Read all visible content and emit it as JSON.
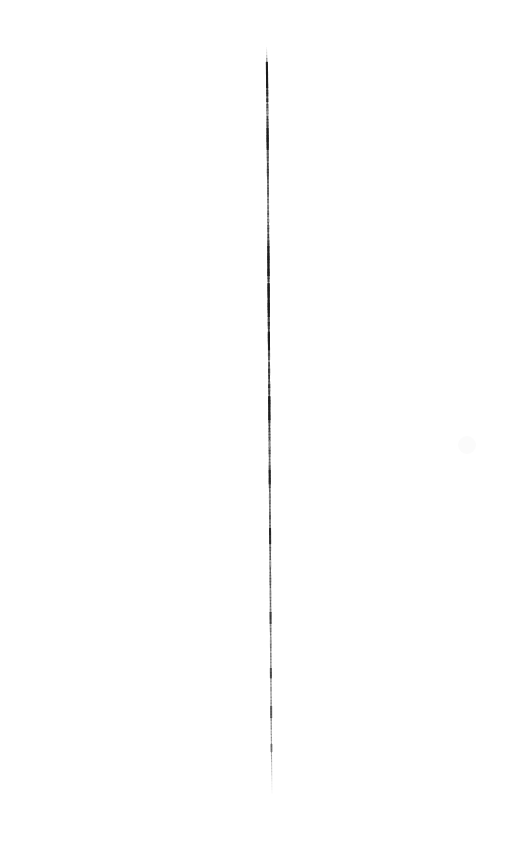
{
  "image": {
    "title": "Vertical Stroke Scan",
    "width": 523,
    "height": 860,
    "background_color": "#ffffff",
    "subject": "single hand-drawn near-vertical line on blank white ground",
    "alt_text": "A single thin dark vertical stroke running down the middle of a blank white page, tapering to faint points at the top and bottom."
  },
  "stroke": {
    "name": "vertical-line",
    "color": "#1a1a1a",
    "color_light": "#6e6e6e",
    "color_faint": "#b8b8b8",
    "top_y": 47,
    "bottom_y": 793,
    "top_x": 267.0,
    "bottom_x": 272.0,
    "max_width_px": 2.4,
    "min_width_px": 0.5,
    "orientation": "vertical",
    "path_points": [
      {
        "y": 47,
        "x": 266.6,
        "w": 0.5,
        "opacity": 0.1
      },
      {
        "y": 52,
        "x": 266.7,
        "w": 0.8,
        "opacity": 0.22
      },
      {
        "y": 58,
        "x": 266.8,
        "w": 1.3,
        "opacity": 0.55
      },
      {
        "y": 64,
        "x": 266.9,
        "w": 1.8,
        "opacity": 0.88
      },
      {
        "y": 72,
        "x": 267.0,
        "w": 2.0,
        "opacity": 0.95
      },
      {
        "y": 90,
        "x": 267.2,
        "w": 2.1,
        "opacity": 0.93
      },
      {
        "y": 110,
        "x": 267.4,
        "w": 2.0,
        "opacity": 0.9
      },
      {
        "y": 135,
        "x": 267.6,
        "w": 2.1,
        "opacity": 0.94
      },
      {
        "y": 160,
        "x": 267.8,
        "w": 2.0,
        "opacity": 0.88
      },
      {
        "y": 185,
        "x": 268.0,
        "w": 1.9,
        "opacity": 0.8
      },
      {
        "y": 205,
        "x": 268.1,
        "w": 1.8,
        "opacity": 0.72
      },
      {
        "y": 225,
        "x": 268.2,
        "w": 1.9,
        "opacity": 0.82
      },
      {
        "y": 250,
        "x": 268.4,
        "w": 2.1,
        "opacity": 0.92
      },
      {
        "y": 275,
        "x": 268.5,
        "w": 2.2,
        "opacity": 0.96
      },
      {
        "y": 300,
        "x": 268.7,
        "w": 2.2,
        "opacity": 0.97
      },
      {
        "y": 325,
        "x": 268.8,
        "w": 2.1,
        "opacity": 0.93
      },
      {
        "y": 350,
        "x": 269.0,
        "w": 2.0,
        "opacity": 0.88
      },
      {
        "y": 375,
        "x": 269.1,
        "w": 2.0,
        "opacity": 0.9
      },
      {
        "y": 400,
        "x": 269.3,
        "w": 2.1,
        "opacity": 0.94
      },
      {
        "y": 425,
        "x": 269.4,
        "w": 2.0,
        "opacity": 0.9
      },
      {
        "y": 450,
        "x": 269.6,
        "w": 1.9,
        "opacity": 0.84
      },
      {
        "y": 475,
        "x": 269.7,
        "w": 1.9,
        "opacity": 0.8
      },
      {
        "y": 500,
        "x": 269.9,
        "w": 1.8,
        "opacity": 0.76
      },
      {
        "y": 525,
        "x": 270.0,
        "w": 1.8,
        "opacity": 0.78
      },
      {
        "y": 550,
        "x": 270.2,
        "w": 1.7,
        "opacity": 0.72
      },
      {
        "y": 575,
        "x": 270.3,
        "w": 1.7,
        "opacity": 0.7
      },
      {
        "y": 600,
        "x": 270.5,
        "w": 1.6,
        "opacity": 0.66
      },
      {
        "y": 625,
        "x": 270.6,
        "w": 1.6,
        "opacity": 0.62
      },
      {
        "y": 650,
        "x": 270.8,
        "w": 1.5,
        "opacity": 0.58
      },
      {
        "y": 675,
        "x": 270.9,
        "w": 1.5,
        "opacity": 0.56
      },
      {
        "y": 700,
        "x": 271.1,
        "w": 1.4,
        "opacity": 0.52
      },
      {
        "y": 720,
        "x": 271.2,
        "w": 1.4,
        "opacity": 0.5
      },
      {
        "y": 740,
        "x": 271.4,
        "w": 1.2,
        "opacity": 0.42
      },
      {
        "y": 755,
        "x": 271.5,
        "w": 1.1,
        "opacity": 0.34
      },
      {
        "y": 768,
        "x": 271.7,
        "w": 0.9,
        "opacity": 0.24
      },
      {
        "y": 778,
        "x": 271.8,
        "w": 0.7,
        "opacity": 0.16
      },
      {
        "y": 786,
        "x": 271.9,
        "w": 0.6,
        "opacity": 0.09
      },
      {
        "y": 793,
        "x": 272.0,
        "w": 0.5,
        "opacity": 0.04
      }
    ],
    "dark_accents": [
      {
        "y": 62,
        "len": 26,
        "opacity": 0.95
      },
      {
        "y": 128,
        "len": 22,
        "opacity": 0.92
      },
      {
        "y": 246,
        "len": 30,
        "opacity": 0.95
      },
      {
        "y": 283,
        "len": 34,
        "opacity": 0.97
      },
      {
        "y": 332,
        "len": 18,
        "opacity": 0.9
      },
      {
        "y": 396,
        "len": 24,
        "opacity": 0.93
      },
      {
        "y": 470,
        "len": 14,
        "opacity": 0.82
      },
      {
        "y": 528,
        "len": 16,
        "opacity": 0.78
      },
      {
        "y": 612,
        "len": 12,
        "opacity": 0.66
      },
      {
        "y": 668,
        "len": 10,
        "opacity": 0.6
      },
      {
        "y": 706,
        "len": 12,
        "opacity": 0.56
      },
      {
        "y": 744,
        "len": 8,
        "opacity": 0.44
      }
    ],
    "light_gaps": [
      {
        "y": 108,
        "len": 8,
        "opacity": 0.3
      },
      {
        "y": 196,
        "len": 10,
        "opacity": 0.26
      },
      {
        "y": 215,
        "len": 7,
        "opacity": 0.32
      },
      {
        "y": 356,
        "len": 6,
        "opacity": 0.34
      },
      {
        "y": 440,
        "len": 8,
        "opacity": 0.3
      },
      {
        "y": 492,
        "len": 9,
        "opacity": 0.28
      },
      {
        "y": 560,
        "len": 7,
        "opacity": 0.3
      },
      {
        "y": 636,
        "len": 8,
        "opacity": 0.26
      },
      {
        "y": 690,
        "len": 6,
        "opacity": 0.24
      },
      {
        "y": 730,
        "len": 7,
        "opacity": 0.22
      }
    ]
  },
  "smudge": {
    "name": "faint-smudge",
    "x": 467,
    "y": 445,
    "radius": 9,
    "opacity": 0.035,
    "color": "#9a9a9a"
  }
}
